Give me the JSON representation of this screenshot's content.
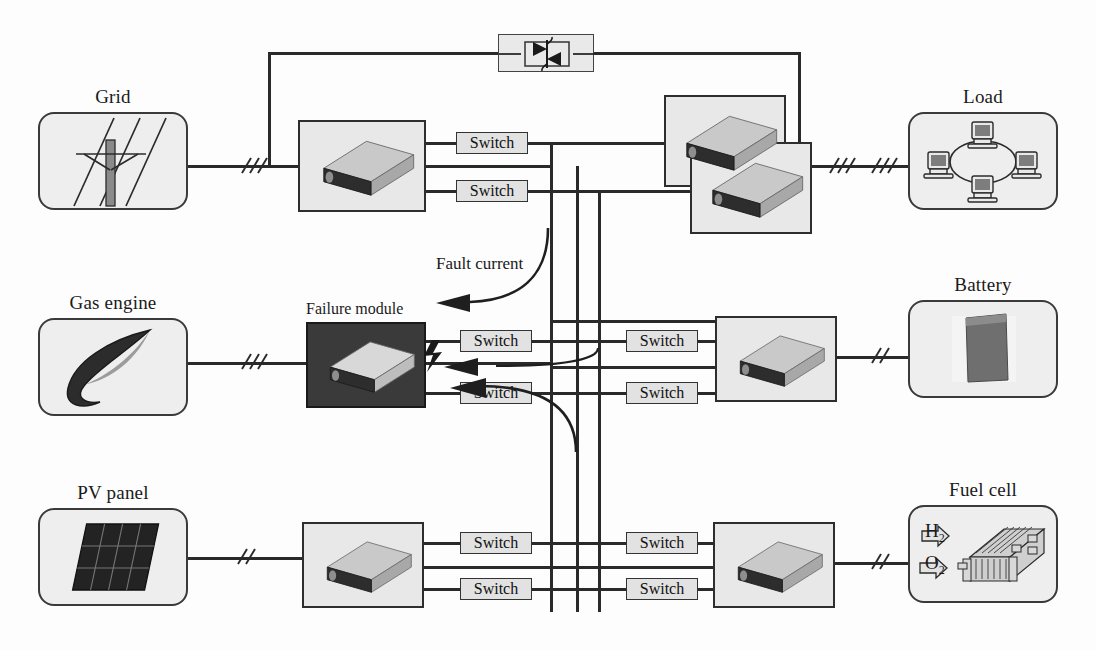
{
  "diagram": {
    "sources": [
      {
        "key": "grid",
        "label": "Grid",
        "icon": "transmission-tower-icon",
        "x": 38,
        "y": 112,
        "w": 150,
        "h": 98
      },
      {
        "key": "gas",
        "label": "Gas engine",
        "icon": "flame-icon",
        "x": 38,
        "y": 318,
        "w": 150,
        "h": 98
      },
      {
        "key": "pv",
        "label": "PV panel",
        "icon": "solar-panel-icon",
        "x": 38,
        "y": 508,
        "w": 150,
        "h": 98
      },
      {
        "key": "load",
        "label": "Load",
        "icon": "computer-network-icon",
        "x": 908,
        "y": 112,
        "w": 150,
        "h": 98
      },
      {
        "key": "battery",
        "label": "Battery",
        "icon": "battery-cell-icon",
        "x": 908,
        "y": 300,
        "w": 150,
        "h": 98
      },
      {
        "key": "fuelcell",
        "label": "Fuel cell",
        "icon": "fuel-cell-stack-icon",
        "x": 908,
        "y": 505,
        "w": 150,
        "h": 98
      }
    ],
    "modules": [
      {
        "key": "grid-converter",
        "label": "",
        "x": 298,
        "y": 120,
        "w": 128,
        "h": 92,
        "dark": false
      },
      {
        "key": "load-converter-rear",
        "label": "",
        "x": 664,
        "y": 95,
        "w": 122,
        "h": 92,
        "dark": false
      },
      {
        "key": "load-converter-front",
        "label": "",
        "x": 690,
        "y": 142,
        "w": 122,
        "h": 92,
        "dark": false
      },
      {
        "key": "failure-module",
        "label": "Failure module",
        "x": 306,
        "y": 322,
        "w": 120,
        "h": 86,
        "dark": true
      },
      {
        "key": "battery-converter",
        "label": "",
        "x": 715,
        "y": 316,
        "w": 122,
        "h": 86,
        "dark": false
      },
      {
        "key": "pv-converter",
        "label": "",
        "x": 302,
        "y": 522,
        "w": 122,
        "h": 86,
        "dark": false
      },
      {
        "key": "fuelcell-converter",
        "label": "",
        "x": 713,
        "y": 522,
        "w": 122,
        "h": 86,
        "dark": false
      }
    ],
    "switches": [
      {
        "key": "sw-grid-top",
        "label": "Switch",
        "x": 456,
        "y": 132,
        "w": 72,
        "h": 22
      },
      {
        "key": "sw-grid-bottom",
        "label": "Switch",
        "x": 456,
        "y": 180,
        "w": 72,
        "h": 22
      },
      {
        "key": "sw-failure-top",
        "label": "Switch",
        "x": 460,
        "y": 330,
        "w": 72,
        "h": 22
      },
      {
        "key": "sw-failure-bottom",
        "label": "Switch",
        "x": 460,
        "y": 382,
        "w": 72,
        "h": 22
      },
      {
        "key": "sw-battery-top",
        "label": "Switch",
        "x": 626,
        "y": 330,
        "w": 72,
        "h": 22
      },
      {
        "key": "sw-battery-bottom",
        "label": "Switch",
        "x": 626,
        "y": 382,
        "w": 72,
        "h": 22
      },
      {
        "key": "sw-pv-top",
        "label": "Switch",
        "x": 460,
        "y": 532,
        "w": 72,
        "h": 22
      },
      {
        "key": "sw-pv-bottom",
        "label": "Switch",
        "x": 460,
        "y": 578,
        "w": 72,
        "h": 22
      },
      {
        "key": "sw-fuelcell-top",
        "label": "Switch",
        "x": 626,
        "y": 532,
        "w": 72,
        "h": 22
      },
      {
        "key": "sw-fuelcell-bottom",
        "label": "Switch",
        "x": 626,
        "y": 578,
        "w": 72,
        "h": 22
      }
    ],
    "annotations": {
      "fault_current": "Fault current",
      "failure_module": "Failure module",
      "hydrogen": "H",
      "hydrogen_sub": "2",
      "oxygen": "O",
      "oxygen_sub": "2"
    },
    "bypass": {
      "component": "anti-parallel-thyristor-icon",
      "x": 498,
      "y": 34,
      "w": 96,
      "h": 38
    },
    "buses": [
      {
        "key": "bus-1",
        "x": 550,
        "y_top": 145,
        "y_bottom": 612
      },
      {
        "key": "bus-2",
        "x": 576,
        "y_top": 166,
        "y_bottom": 612
      },
      {
        "key": "bus-3",
        "x": 598,
        "y_top": 190,
        "y_bottom": 612
      }
    ],
    "phase_ticks": [
      {
        "key": "tick-grid",
        "x": 236,
        "y": 166,
        "count": 3
      },
      {
        "key": "tick-gas",
        "x": 236,
        "y": 362,
        "count": 3
      },
      {
        "key": "tick-pv",
        "x": 232,
        "y": 557,
        "count": 2
      },
      {
        "key": "tick-load",
        "x": 866,
        "y": 166,
        "count": 3
      },
      {
        "key": "tick-battery",
        "x": 866,
        "y": 356,
        "count": 2
      },
      {
        "key": "tick-fuelcell",
        "x": 866,
        "y": 562,
        "count": 2
      },
      {
        "key": "tick-bypass",
        "x": 824,
        "y": 166,
        "count": 3
      }
    ],
    "colors": {
      "line": "#2a2a2a",
      "panel_fill": "#eeeeee",
      "panel_border": "#3a3a3a",
      "module_fill": "#e8e8e8",
      "module_dark": "#3a3a3a",
      "switch_fill": "#e2e2e2",
      "text": "#1a1a1a"
    }
  }
}
